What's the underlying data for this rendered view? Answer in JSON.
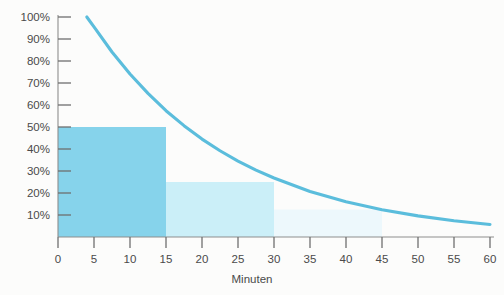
{
  "chart_data": {
    "type": "area",
    "title": "",
    "subtitle": "",
    "xlabel": "Minuten",
    "ylabel": "",
    "xlim": [
      0,
      60
    ],
    "ylim": [
      0,
      100
    ],
    "grid": false,
    "legend": null,
    "x_ticks": [
      0,
      5,
      10,
      15,
      20,
      25,
      30,
      35,
      40,
      45,
      50,
      55,
      60
    ],
    "x_tick_labels": [
      "0",
      "5",
      "10",
      "15",
      "20",
      "25",
      "30",
      "35",
      "40",
      "45",
      "50",
      "55",
      "60"
    ],
    "y_ticks": [
      10,
      20,
      30,
      40,
      50,
      60,
      70,
      80,
      90,
      100
    ],
    "y_tick_labels": [
      "10%",
      "20%",
      "30%",
      "40%",
      "50%",
      "60%",
      "70%",
      "80%",
      "90%",
      "100%"
    ],
    "series": [
      {
        "name": "Zerfallskurve",
        "type": "line",
        "color": "#5BBDDC",
        "note": "Exponentieller Zerfall, Halbwertszeit 15 Minuten",
        "half_life_minutes": 15,
        "x_start": 4,
        "x_end": 60,
        "points": [
          {
            "x": 4,
            "y": 100
          },
          {
            "x": 5,
            "y": 95.5
          },
          {
            "x": 7.5,
            "y": 84.1
          },
          {
            "x": 10,
            "y": 74.1
          },
          {
            "x": 12.5,
            "y": 65.3
          },
          {
            "x": 15,
            "y": 57.4
          },
          {
            "x": 17.5,
            "y": 50.6
          },
          {
            "x": 20,
            "y": 44.5
          },
          {
            "x": 22.5,
            "y": 39.2
          },
          {
            "x": 25,
            "y": 34.5
          },
          {
            "x": 27.5,
            "y": 30.4
          },
          {
            "x": 30,
            "y": 26.8
          },
          {
            "x": 35,
            "y": 20.7
          },
          {
            "x": 40,
            "y": 16.0
          },
          {
            "x": 45,
            "y": 12.4
          },
          {
            "x": 50,
            "y": 9.6
          },
          {
            "x": 55,
            "y": 7.4
          },
          {
            "x": 60,
            "y": 5.7
          }
        ]
      },
      {
        "name": "Halbwertszeit-Stufen",
        "type": "bar",
        "bars": [
          {
            "label": "0–15 min",
            "x_start": 0,
            "x_end": 15,
            "value": 50,
            "color": "#86D3EB"
          },
          {
            "label": "15–30 min",
            "x_start": 15,
            "x_end": 30,
            "value": 25,
            "color": "#CBEFF8"
          },
          {
            "label": "30–45 min",
            "x_start": 30,
            "x_end": 45,
            "value": 12.5,
            "color": "#EDF8FC"
          }
        ]
      }
    ]
  },
  "colors": {
    "curve": "#5BBDDC",
    "bar_1": "#86D3EB",
    "bar_2": "#CBEFF8",
    "bar_3": "#EDF8FC",
    "axis": "#8d8d8d",
    "text": "#4a4a4a",
    "background": "#fcfcfb"
  }
}
